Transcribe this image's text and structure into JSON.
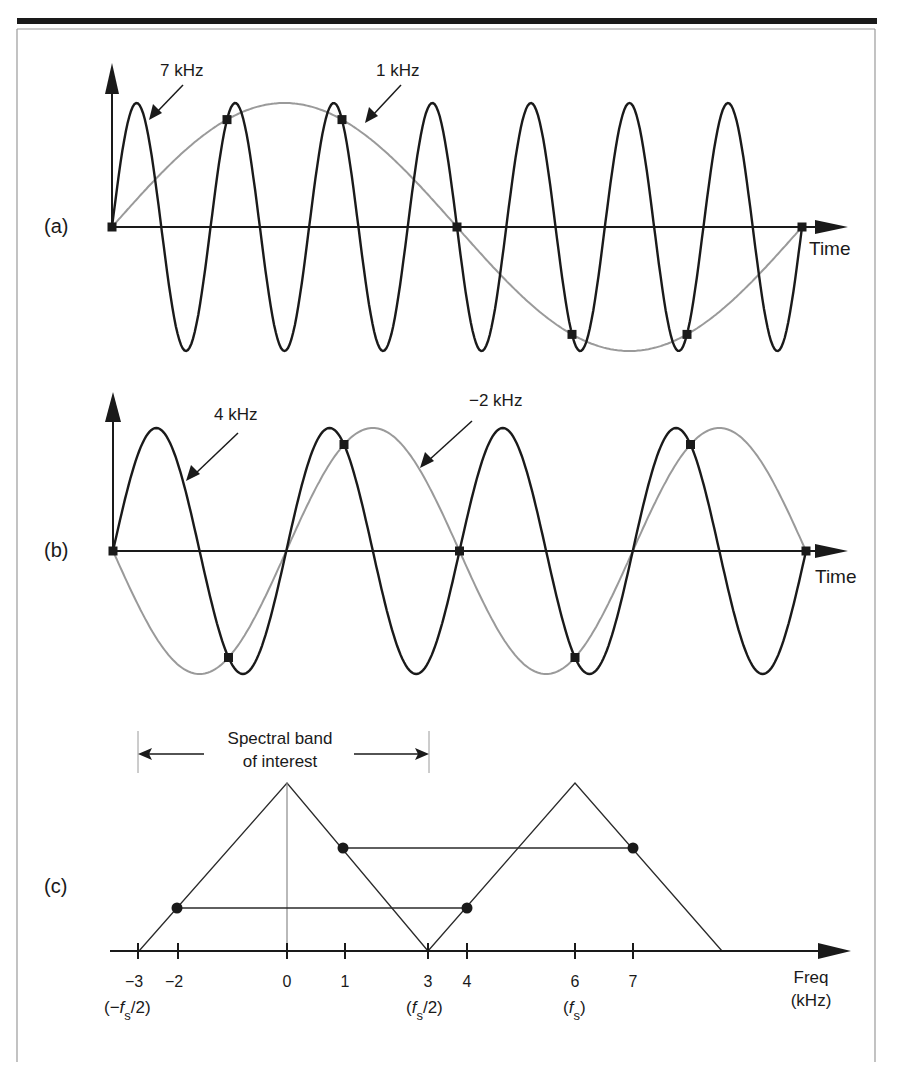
{
  "figure": {
    "panels": [
      {
        "id": "a",
        "label": "(a)",
        "x_axis_label": "Time",
        "signals": [
          {
            "name": "7 kHz",
            "label": "7 kHz",
            "frequency_khz": 7,
            "color": "#1a1a1a"
          },
          {
            "name": "1 kHz",
            "label": "1 kHz",
            "frequency_khz": 1,
            "color": "#9a9a9a"
          }
        ],
        "sample_count": 7
      },
      {
        "id": "b",
        "label": "(b)",
        "x_axis_label": "Time",
        "signals": [
          {
            "name": "4 kHz",
            "label": "4 kHz",
            "frequency_khz": 4,
            "color": "#1a1a1a"
          },
          {
            "name": "-2 kHz",
            "label": "−2 kHz",
            "frequency_khz": -2,
            "color": "#9a9a9a"
          }
        ],
        "sample_count": 7
      },
      {
        "id": "c",
        "label": "(c)",
        "band_annotation_line1": "Spectral band",
        "band_annotation_line2": "of interest",
        "x_axis_label_line1": "Freq",
        "x_axis_label_line2": "(kHz)",
        "ticks": [
          {
            "value": "−3",
            "sub": "(−f_s/2)"
          },
          {
            "value": "−2",
            "sub": ""
          },
          {
            "value": "0",
            "sub": ""
          },
          {
            "value": "1",
            "sub": ""
          },
          {
            "value": "3",
            "sub": "(f_s/2)"
          },
          {
            "value": "4",
            "sub": ""
          },
          {
            "value": "6",
            "sub": "(f_s)"
          },
          {
            "value": "7",
            "sub": ""
          }
        ],
        "sub_labels": {
          "neg_half_fs_prefix": "(−",
          "f": "f",
          "s": "s",
          "half_suffix": "/2)",
          "open": "(",
          "close": ")"
        }
      }
    ]
  },
  "chart_data": {
    "type": "line",
    "title": "",
    "sampling_rate_khz": 6,
    "panels": [
      {
        "panel": "(a)",
        "xlabel": "Time",
        "series": [
          {
            "name": "7 kHz",
            "type": "sinusoid",
            "frequency_khz": 7,
            "cycles_shown": 7
          },
          {
            "name": "1 kHz",
            "type": "sinusoid",
            "frequency_khz": 1,
            "cycles_shown": 1
          }
        ],
        "samples": 7,
        "note": "7 kHz and 1 kHz share identical sample values at fs = 6 kHz"
      },
      {
        "panel": "(b)",
        "xlabel": "Time",
        "series": [
          {
            "name": "4 kHz",
            "type": "sinusoid",
            "frequency_khz": 4,
            "cycles_shown": 4
          },
          {
            "name": "-2 kHz",
            "type": "sinusoid",
            "frequency_khz": -2,
            "cycles_shown": 2
          }
        ],
        "samples": 7,
        "note": "4 kHz and -2 kHz share identical sample values at fs = 6 kHz"
      },
      {
        "panel": "(c)",
        "xlabel": "Freq (kHz)",
        "x_ticks": [
          -3,
          -2,
          0,
          1,
          3,
          4,
          6,
          7
        ],
        "spectral_replicas": [
          {
            "center_khz": 0,
            "span_khz": [
              -3,
              3
            ]
          },
          {
            "center_khz": 6,
            "span_khz": [
              3,
              9
            ]
          }
        ],
        "alias_pairs": [
          {
            "from_khz": -2,
            "to_khz": 4
          },
          {
            "from_khz": 1,
            "to_khz": 7
          }
        ],
        "band_of_interest_khz": [
          -3,
          3
        ]
      }
    ]
  }
}
